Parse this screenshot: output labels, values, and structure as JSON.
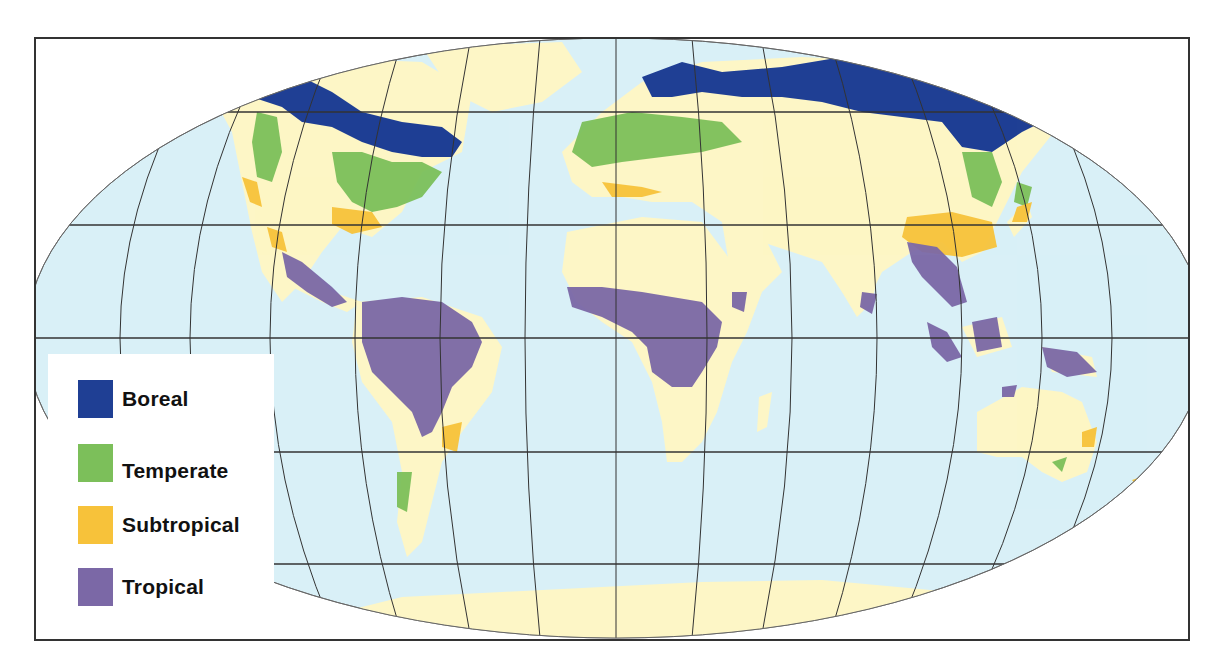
{
  "map": {
    "projection": "Robinson",
    "colors": {
      "ocean": "#d9f0f7",
      "land": "#fdf6c6",
      "graticule": "#333333",
      "frame": "#333333"
    }
  },
  "legend": {
    "items": [
      {
        "label": "Boreal",
        "color": "#1f3f94"
      },
      {
        "label": "Temperate",
        "color": "#7cbf5a"
      },
      {
        "label": "Subtropical",
        "color": "#f7c23a"
      },
      {
        "label": "Tropical",
        "color": "#7b68a6"
      }
    ]
  }
}
